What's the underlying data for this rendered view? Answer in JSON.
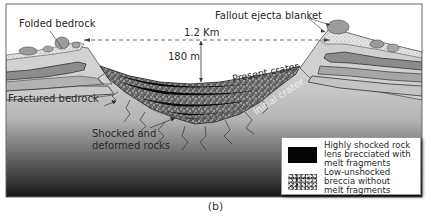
{
  "figure": {
    "caption": "(b)",
    "labels": {
      "folded_bedrock": "Folded bedrock",
      "fallout_ejecta_blanket": "Fallout ejecta blanket",
      "diameter": "1.2 Km",
      "depth": "180 m",
      "present_crater": "Present crater",
      "initial_crater": "Initial crater",
      "fractured_bedrock": "Fractured bedrock",
      "shocked_rocks_line1": "Shocked and",
      "shocked_rocks_line2": "deformed rocks"
    },
    "legend": {
      "items": [
        {
          "swatch": "solid-black",
          "text": "Highly shocked rock\nlens brecciated with\nmelt fragments"
        },
        {
          "swatch": "speckled-gray",
          "text": "Low-unshocked\nbreccia without\nmelt fragments"
        }
      ]
    },
    "colors": {
      "sky": "#ffffff",
      "frame": "#555555",
      "ground_top": "#d8d8d8",
      "ground_bottom": "#1a1a1a",
      "layer_light": "#d4d4d4",
      "layer_mid": "#a9a9a9",
      "layer_dark": "#7a7a7a",
      "ejecta_speckle": "#e6e6e6",
      "boulder": "#9a9a9a",
      "breccia": "#6e6e6e",
      "melt_lens": "#0a0a0a"
    }
  }
}
